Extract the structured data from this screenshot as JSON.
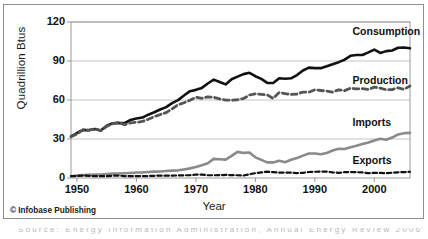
{
  "figure": {
    "credit": "© Infobase Publishing",
    "bottom_caption": "Source: Energy Information Administration, Annual Energy Review 2006"
  },
  "chart_data": {
    "type": "line",
    "title": "",
    "xlabel": "Year",
    "ylabel": "Quadrillion Btus",
    "xlim": [
      1949,
      2006
    ],
    "ylim": [
      0,
      120
    ],
    "yticks": [
      0,
      30,
      60,
      90,
      120
    ],
    "xticks": [
      1950,
      1960,
      1970,
      1980,
      1990,
      2000
    ],
    "grid": "horizontal",
    "legend_position": "inline-right-labels",
    "x": [
      1949,
      1950,
      1951,
      1952,
      1953,
      1954,
      1955,
      1956,
      1957,
      1958,
      1959,
      1960,
      1961,
      1962,
      1963,
      1964,
      1965,
      1966,
      1967,
      1968,
      1969,
      1970,
      1971,
      1972,
      1973,
      1974,
      1975,
      1976,
      1977,
      1978,
      1979,
      1980,
      1981,
      1982,
      1983,
      1984,
      1985,
      1986,
      1987,
      1988,
      1989,
      1990,
      1991,
      1992,
      1993,
      1994,
      1995,
      1996,
      1997,
      1998,
      1999,
      2000,
      2001,
      2002,
      2003,
      2004,
      2005,
      2006
    ],
    "series": [
      {
        "name": "Consumption",
        "color": "#111111",
        "style": "solid",
        "width": 2.6,
        "label_x": 1997,
        "label_y": 112,
        "values": [
          32.0,
          34.6,
          37.0,
          36.7,
          37.7,
          36.6,
          40.2,
          42.1,
          42.3,
          42.2,
          44.6,
          45.7,
          46.5,
          48.7,
          50.6,
          52.7,
          54.5,
          57.6,
          59.9,
          63.5,
          66.8,
          67.8,
          69.3,
          72.7,
          75.7,
          73.9,
          72.0,
          76.0,
          78.0,
          79.9,
          80.9,
          78.3,
          76.2,
          73.2,
          73.1,
          76.7,
          76.4,
          76.7,
          79.2,
          82.7,
          84.9,
          84.5,
          84.5,
          85.9,
          87.5,
          89.1,
          91.0,
          94.0,
          94.6,
          94.6,
          96.6,
          98.8,
          96.2,
          97.6,
          98.1,
          100.2,
          100.4,
          99.8
        ]
      },
      {
        "name": "Production",
        "color": "#555555",
        "style": "dashed",
        "width": 2.8,
        "label_x": 1997,
        "label_y": 75,
        "values": [
          31.7,
          33.9,
          37.0,
          36.8,
          37.8,
          36.5,
          39.7,
          41.8,
          42.8,
          40.9,
          42.4,
          42.8,
          43.5,
          45.2,
          47.2,
          48.8,
          50.3,
          53.2,
          56.3,
          57.9,
          59.8,
          62.1,
          61.3,
          62.4,
          62.1,
          60.8,
          59.9,
          59.9,
          60.2,
          61.1,
          63.8,
          64.8,
          64.4,
          63.9,
          61.2,
          65.8,
          64.9,
          64.3,
          64.6,
          66.1,
          66.0,
          67.8,
          67.3,
          66.9,
          66.1,
          67.8,
          67.2,
          69.1,
          68.5,
          68.7,
          68.1,
          69.9,
          69.1,
          67.9,
          68.0,
          69.4,
          68.2,
          70.8
        ]
      },
      {
        "name": "Imports",
        "color": "#8a8a8a",
        "style": "solid",
        "width": 2.6,
        "label_x": 1997,
        "label_y": 42,
        "values": [
          1.4,
          1.9,
          2.2,
          2.4,
          2.7,
          2.7,
          3.1,
          3.4,
          3.5,
          3.7,
          3.9,
          4.2,
          4.3,
          4.6,
          4.9,
          5.0,
          5.4,
          5.7,
          5.9,
          6.6,
          7.4,
          8.4,
          9.8,
          11.4,
          14.7,
          14.4,
          14.1,
          17.0,
          20.1,
          19.3,
          19.6,
          15.9,
          13.9,
          12.0,
          12.0,
          13.2,
          12.1,
          14.0,
          15.4,
          17.2,
          18.8,
          18.8,
          18.3,
          19.2,
          21.1,
          22.5,
          22.3,
          23.7,
          24.8,
          26.2,
          27.3,
          28.9,
          30.2,
          29.4,
          31.1,
          33.5,
          34.5,
          34.7
        ]
      },
      {
        "name": "Exports",
        "color": "#111111",
        "style": "dashed",
        "width": 2.2,
        "label_x": 1997,
        "label_y": 13,
        "values": [
          1.5,
          1.5,
          1.9,
          1.7,
          1.4,
          1.4,
          1.4,
          1.7,
          1.9,
          1.5,
          1.4,
          1.5,
          1.5,
          1.5,
          1.7,
          1.8,
          1.8,
          1.8,
          2.0,
          2.1,
          2.1,
          2.7,
          2.6,
          2.1,
          2.1,
          2.2,
          2.4,
          2.2,
          2.1,
          1.9,
          2.9,
          3.7,
          4.3,
          4.9,
          4.5,
          4.2,
          4.2,
          4.1,
          3.8,
          4.0,
          4.6,
          4.8,
          5.0,
          4.9,
          4.3,
          4.0,
          4.5,
          4.6,
          4.5,
          4.3,
          3.7,
          4.0,
          3.9,
          3.7,
          4.1,
          4.4,
          4.5,
          4.8
        ]
      }
    ]
  }
}
